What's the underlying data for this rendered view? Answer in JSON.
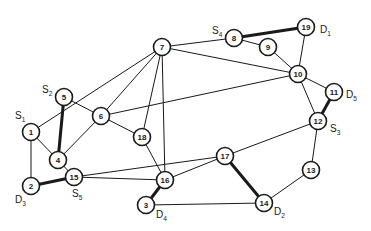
{
  "diagram": {
    "type": "network-graph",
    "nodes": [
      {
        "id": "1",
        "label": "1",
        "terminal": "S",
        "terminal_index": "1"
      },
      {
        "id": "2",
        "label": "2",
        "terminal": "D",
        "terminal_index": "3"
      },
      {
        "id": "3",
        "label": "3",
        "terminal": "D",
        "terminal_index": "4"
      },
      {
        "id": "4",
        "label": "4"
      },
      {
        "id": "5",
        "label": "5",
        "terminal": "S",
        "terminal_index": "2"
      },
      {
        "id": "6",
        "label": "6"
      },
      {
        "id": "7",
        "label": "7"
      },
      {
        "id": "8",
        "label": "8",
        "terminal": "S",
        "terminal_index": "4"
      },
      {
        "id": "9",
        "label": "9"
      },
      {
        "id": "10",
        "label": "10"
      },
      {
        "id": "11",
        "label": "11",
        "terminal": "D",
        "terminal_index": "5"
      },
      {
        "id": "12",
        "label": "12",
        "terminal": "S",
        "terminal_index": "3"
      },
      {
        "id": "13",
        "label": "13"
      },
      {
        "id": "14",
        "label": "14",
        "terminal": "D",
        "terminal_index": "2"
      },
      {
        "id": "15",
        "label": "15",
        "terminal": "S",
        "terminal_index": "5"
      },
      {
        "id": "16",
        "label": "16"
      },
      {
        "id": "17",
        "label": "17"
      },
      {
        "id": "18",
        "label": "18"
      },
      {
        "id": "19",
        "label": "19",
        "terminal": "D",
        "terminal_index": "1"
      }
    ],
    "edges": [
      {
        "from": "1",
        "to": "7",
        "emphasis": false
      },
      {
        "from": "1",
        "to": "4",
        "emphasis": false
      },
      {
        "from": "1",
        "to": "2",
        "emphasis": false
      },
      {
        "from": "5",
        "to": "4",
        "emphasis": true
      },
      {
        "from": "5",
        "to": "6",
        "emphasis": false
      },
      {
        "from": "4",
        "to": "6",
        "emphasis": false
      },
      {
        "from": "4",
        "to": "15",
        "emphasis": false
      },
      {
        "from": "2",
        "to": "15",
        "emphasis": true
      },
      {
        "from": "6",
        "to": "7",
        "emphasis": false
      },
      {
        "from": "6",
        "to": "18",
        "emphasis": false
      },
      {
        "from": "6",
        "to": "10",
        "emphasis": false
      },
      {
        "from": "7",
        "to": "18",
        "emphasis": false
      },
      {
        "from": "7",
        "to": "16",
        "emphasis": false
      },
      {
        "from": "7",
        "to": "8",
        "emphasis": false
      },
      {
        "from": "7",
        "to": "10",
        "emphasis": false
      },
      {
        "from": "8",
        "to": "19",
        "emphasis": true
      },
      {
        "from": "8",
        "to": "9",
        "emphasis": false
      },
      {
        "from": "9",
        "to": "10",
        "emphasis": false
      },
      {
        "from": "19",
        "to": "10",
        "emphasis": false
      },
      {
        "from": "10",
        "to": "11",
        "emphasis": false
      },
      {
        "from": "10",
        "to": "12",
        "emphasis": false
      },
      {
        "from": "11",
        "to": "12",
        "emphasis": true
      },
      {
        "from": "12",
        "to": "17",
        "emphasis": false
      },
      {
        "from": "12",
        "to": "13",
        "emphasis": false
      },
      {
        "from": "13",
        "to": "14",
        "emphasis": false
      },
      {
        "from": "17",
        "to": "14",
        "emphasis": true
      },
      {
        "from": "3",
        "to": "14",
        "emphasis": false
      },
      {
        "from": "16",
        "to": "3",
        "emphasis": true
      },
      {
        "from": "18",
        "to": "16",
        "emphasis": false
      },
      {
        "from": "15",
        "to": "16",
        "emphasis": false
      },
      {
        "from": "15",
        "to": "17",
        "emphasis": false
      },
      {
        "from": "16",
        "to": "17",
        "emphasis": false
      }
    ]
  }
}
